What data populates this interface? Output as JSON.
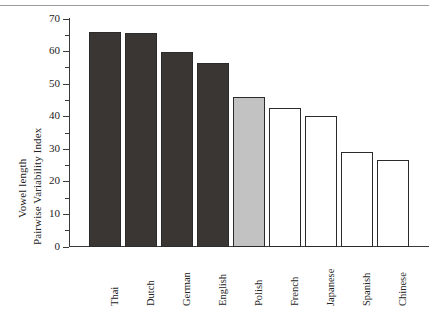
{
  "figure": {
    "background_color": "#ffffff",
    "axis_color": "#3b3b3b"
  },
  "axis": {
    "ylabel_line1": "Vowel length",
    "ylabel_line2": "Pairwise Variability Index",
    "ytick_labels": [
      "0",
      "10",
      "20",
      "30",
      "40",
      "50",
      "60",
      "70"
    ],
    "ytick_values": [
      0,
      10,
      20,
      30,
      40,
      50,
      60,
      70
    ],
    "yminor_values": [
      5,
      15,
      25,
      35,
      45,
      55,
      65
    ],
    "xlabel": ""
  },
  "chart_data": {
    "type": "bar",
    "title": "",
    "xlabel": "",
    "ylabel": "Vowel length Pairwise Variability Index",
    "ylim": [
      0,
      70
    ],
    "ytick_step": 10,
    "yminor_step": 5,
    "grid": false,
    "legend": false,
    "categories": [
      "Thai",
      "Dutch",
      "German",
      "English",
      "Polish",
      "French",
      "Japanese",
      "Spanish",
      "Chinese"
    ],
    "values": [
      66.0,
      65.6,
      59.8,
      56.6,
      46.0,
      42.8,
      40.2,
      29.2,
      26.6
    ],
    "bar_colors": [
      "#3a3633",
      "#3a3633",
      "#3a3633",
      "#3a3633",
      "#c2c2c2",
      "#ffffff",
      "#ffffff",
      "#ffffff",
      "#ffffff"
    ],
    "bar_edge_color": "#2b2b2b",
    "bars": [
      {
        "label": "Thai",
        "value": 66.0,
        "fill": "#3a3633"
      },
      {
        "label": "Dutch",
        "value": 65.6,
        "fill": "#3a3633"
      },
      {
        "label": "German",
        "value": 59.8,
        "fill": "#3a3633"
      },
      {
        "label": "English",
        "value": 56.6,
        "fill": "#3a3633"
      },
      {
        "label": "Polish",
        "value": 46.0,
        "fill": "#c2c2c2"
      },
      {
        "label": "French",
        "value": 42.8,
        "fill": "#ffffff"
      },
      {
        "label": "Japanese",
        "value": 40.2,
        "fill": "#ffffff"
      },
      {
        "label": "Spanish",
        "value": 29.2,
        "fill": "#ffffff"
      },
      {
        "label": "Chinese",
        "value": 26.6,
        "fill": "#ffffff"
      }
    ]
  }
}
